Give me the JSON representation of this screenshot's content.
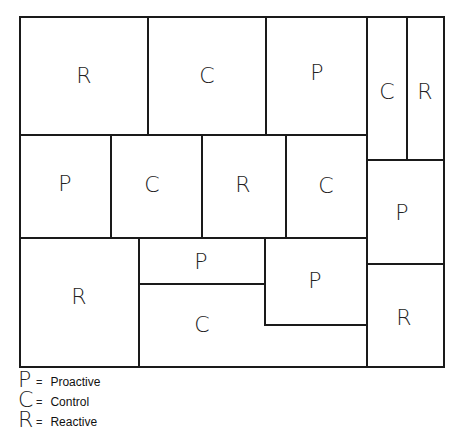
{
  "diagram": {
    "title": "",
    "border_color": "#1a1a1a",
    "cells": [
      {
        "label": "R",
        "x": 19,
        "y": 16,
        "w": 129,
        "h": 119
      },
      {
        "label": "C",
        "x": 148,
        "y": 16,
        "w": 117,
        "h": 119
      },
      {
        "label": "P",
        "x": 265,
        "y": 16,
        "w": 102,
        "h": 119
      },
      {
        "label": "C",
        "x": 367,
        "y": 16,
        "w": 40,
        "h": 144
      },
      {
        "label": "R",
        "x": 407,
        "y": 16,
        "w": 37,
        "h": 144
      },
      {
        "label": "P",
        "x": 19,
        "y": 135,
        "w": 92,
        "h": 103
      },
      {
        "label": "C",
        "x": 111,
        "y": 135,
        "w": 91,
        "h": 103
      },
      {
        "label": "R",
        "x": 202,
        "y": 135,
        "w": 84,
        "h": 103
      },
      {
        "label": "C",
        "x": 286,
        "y": 135,
        "w": 81,
        "h": 103
      },
      {
        "label": "P",
        "x": 367,
        "y": 160,
        "w": 77,
        "h": 104
      },
      {
        "label": "R",
        "x": 19,
        "y": 238,
        "w": 120,
        "h": 129
      },
      {
        "label": "P",
        "x": 139,
        "y": 238,
        "w": 126,
        "h": 46
      },
      {
        "label": "P",
        "x": 265,
        "y": 238,
        "w": 102,
        "h": 87
      },
      {
        "label": "C",
        "x": 139,
        "y": 284,
        "w": 126,
        "h": 83
      },
      {
        "label": "R",
        "x": 367,
        "y": 264,
        "w": 77,
        "h": 103
      }
    ]
  },
  "legend": {
    "items": [
      {
        "letter": "P",
        "eq": "=",
        "text": "Proactive"
      },
      {
        "letter": "C",
        "eq": "=",
        "text": "Control"
      },
      {
        "letter": "R",
        "eq": "=",
        "text": "Reactive"
      }
    ]
  }
}
